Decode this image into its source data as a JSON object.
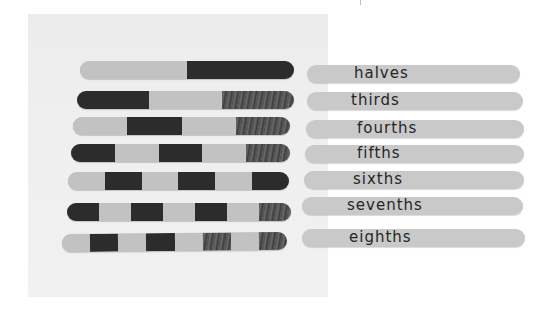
{
  "scene": {
    "description": "Popsicle sticks colored in equal segments to show fractions, with matching labeled sticks",
    "colors": {
      "stick_light": "#c2c2c2",
      "stick_dark": "#2c2c2c",
      "label_stick": "#c9c9c9",
      "text": "#262626"
    }
  },
  "fraction_sticks": [
    {
      "name": "halves",
      "parts": 2,
      "pattern": [
        "light",
        "dark"
      ]
    },
    {
      "name": "thirds",
      "parts": 3,
      "pattern": [
        "dark",
        "light",
        "mottled"
      ]
    },
    {
      "name": "fourths",
      "parts": 4,
      "pattern": [
        "light",
        "dark",
        "light",
        "mottled"
      ]
    },
    {
      "name": "fifths",
      "parts": 5,
      "pattern": [
        "dark",
        "light",
        "dark",
        "light",
        "mottled"
      ]
    },
    {
      "name": "sixths",
      "parts": 6,
      "pattern": [
        "light",
        "dark",
        "light",
        "dark",
        "light",
        "dark"
      ]
    },
    {
      "name": "sevenths",
      "parts": 7,
      "pattern": [
        "dark",
        "light",
        "dark",
        "light",
        "dark",
        "light",
        "mottled"
      ]
    },
    {
      "name": "eighths",
      "parts": 8,
      "pattern": [
        "light",
        "dark",
        "light",
        "dark",
        "light",
        "mottled",
        "light",
        "mottled"
      ]
    }
  ],
  "labels": [
    {
      "text": "halves"
    },
    {
      "text": "thirds"
    },
    {
      "text": "fourths"
    },
    {
      "text": "fifths"
    },
    {
      "text": "sixths"
    },
    {
      "text": "sevenths"
    },
    {
      "text": "eighths"
    }
  ]
}
